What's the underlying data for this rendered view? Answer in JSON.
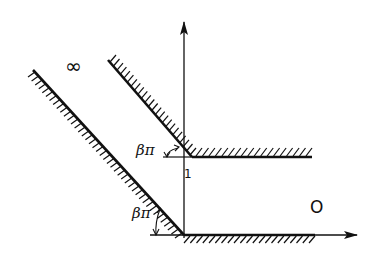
{
  "figure": {
    "type": "conformal-mapping-channel-diagram",
    "colors": {
      "ink": "#111111",
      "background": "#ffffff"
    },
    "labels": {
      "infinity": "∞",
      "origin": "O",
      "unit_mark": "1",
      "angle_upper": "βπ",
      "angle_lower": "βπ"
    },
    "axes": {
      "vertical": {
        "x": 184,
        "y_top": 22,
        "y_bottom": 238,
        "arrow": "up"
      },
      "horizontal": {
        "y": 235,
        "x_left": 150,
        "x_right": 357,
        "arrow": "right"
      }
    },
    "walls": [
      {
        "name": "lower-slanted-wall",
        "from": [
          33,
          70
        ],
        "to": [
          184,
          235
        ],
        "hatch_side": "lower-left"
      },
      {
        "name": "lower-horizontal-wall",
        "from": [
          184,
          235
        ],
        "to": [
          315,
          235
        ],
        "hatch_side": "below"
      },
      {
        "name": "upper-slanted-wall",
        "from": [
          108,
          60
        ],
        "to": [
          192,
          157
        ],
        "hatch_side": "upper-right"
      },
      {
        "name": "upper-horizontal-wall",
        "from": [
          192,
          157
        ],
        "to": [
          312,
          157
        ],
        "hatch_side": "above"
      }
    ]
  }
}
